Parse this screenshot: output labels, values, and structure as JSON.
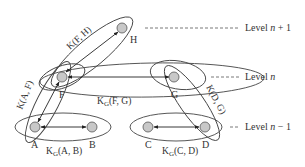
{
  "diagram": {
    "nodes": [
      {
        "id": "H",
        "label": "H",
        "x": 122,
        "y": 28
      },
      {
        "id": "F",
        "label": "F",
        "x": 62,
        "y": 77
      },
      {
        "id": "G",
        "label": "G",
        "x": 174,
        "y": 77
      },
      {
        "id": "A",
        "label": "A",
        "x": 35,
        "y": 127
      },
      {
        "id": "B",
        "label": "B",
        "x": 92,
        "y": 127
      },
      {
        "id": "C",
        "label": "C",
        "x": 148,
        "y": 127
      },
      {
        "id": "D",
        "label": "D",
        "x": 205,
        "y": 127
      }
    ],
    "levels": [
      {
        "label_prefix": "Level ",
        "var": "n",
        "suffix": " + 1"
      },
      {
        "label_prefix": "Level ",
        "var": "n",
        "suffix": ""
      },
      {
        "label_prefix": "Level ",
        "var": "n",
        "suffix": " − 1"
      }
    ],
    "groups": {
      "k_fh": "K(F, H)",
      "k_af": "K(A, F)",
      "k_dg": "K(D, G)",
      "kg_fg": {
        "main": "K",
        "sub": "G",
        "args": "(F, G)"
      },
      "kg_ab": {
        "main": "K",
        "sub": "G",
        "args": "(A, B)"
      },
      "kg_cd": {
        "main": "K",
        "sub": "G",
        "args": "(C, D)"
      }
    },
    "colors": {
      "node_fill": "#c8c8c8",
      "stroke": "#333333"
    }
  }
}
